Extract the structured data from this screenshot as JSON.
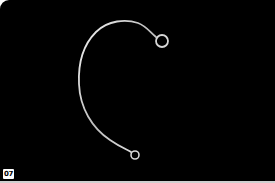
{
  "image": {
    "subject": "wire-earring-hook",
    "background_color": "#000000",
    "wire_color": "#d8d8d8"
  },
  "badge": {
    "label": "07"
  }
}
